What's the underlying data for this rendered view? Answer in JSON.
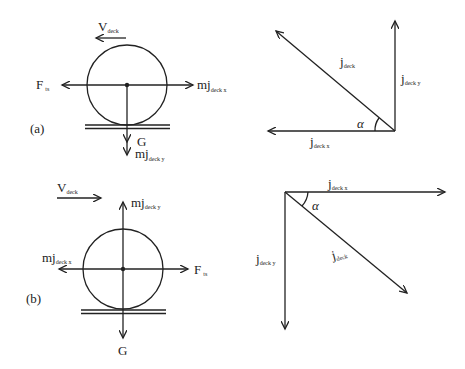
{
  "figure": {
    "panel_a": {
      "label": "(a)",
      "free_body": {
        "velocity": {
          "main": "V",
          "sub": "deck",
          "direction": "left"
        },
        "force_left": {
          "main": "F",
          "sub": "ts",
          "direction": "left"
        },
        "inertia_x": {
          "main": "mj",
          "sub": "deck x",
          "direction": "right"
        },
        "gravity": {
          "main": "G",
          "direction": "down"
        },
        "inertia_y": {
          "main": "mj",
          "sub": "deck y",
          "direction": "down"
        }
      },
      "vectors": {
        "resultant": {
          "main": "j",
          "sub": "deck",
          "direction": "up-left"
        },
        "component_y": {
          "main": "j",
          "sub": "deck y",
          "direction": "up"
        },
        "component_x": {
          "main": "j",
          "sub": "deck x",
          "direction": "left"
        },
        "angle": "α"
      }
    },
    "panel_b": {
      "label": "(b)",
      "free_body": {
        "velocity": {
          "main": "V",
          "sub": "deck",
          "direction": "right"
        },
        "inertia_y": {
          "main": "mj",
          "sub": "deck y",
          "direction": "up"
        },
        "inertia_x": {
          "main": "mj",
          "sub": "deck x",
          "direction": "left"
        },
        "force_right": {
          "main": "F",
          "sub": "ts",
          "direction": "right"
        },
        "gravity": {
          "main": "G",
          "direction": "down"
        }
      },
      "vectors": {
        "component_x": {
          "main": "j",
          "sub": "deck x",
          "direction": "right"
        },
        "component_y": {
          "main": "j",
          "sub": "deck y",
          "direction": "down"
        },
        "resultant": {
          "main": "j",
          "sub": "deck",
          "direction": "down-right"
        },
        "angle": "α"
      }
    }
  }
}
